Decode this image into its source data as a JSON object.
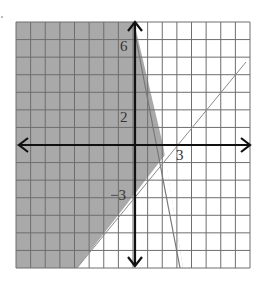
{
  "chart_data": {
    "type": "inequality-graph",
    "title": "",
    "xlabel": "",
    "ylabel": "",
    "xlim": [
      -8,
      8
    ],
    "ylim": [
      -7,
      7
    ],
    "grid": true,
    "tick_labels": {
      "x": [
        {
          "value": 3,
          "label": "3"
        }
      ],
      "y": [
        {
          "value": 6,
          "label": "6"
        },
        {
          "value": 2,
          "label": "2"
        },
        {
          "value": -3,
          "label": "-3"
        }
      ]
    },
    "lines": [
      {
        "name": "steep boundary",
        "equation": "y = -3.5x + 7",
        "style": "solid",
        "points": [
          [
            0,
            7
          ],
          [
            4,
            -7
          ]
        ]
      },
      {
        "name": "diagonal boundary",
        "equation": "y = x - 3",
        "style": "solid-thin",
        "points": [
          [
            -4,
            -7
          ],
          [
            8,
            5
          ]
        ]
      }
    ],
    "shaded_region": {
      "description": "y <= -3.5x + 7 and y >= x - 3 (left side)",
      "color": "#a8a8a8"
    }
  },
  "colors": {
    "shade": "#a9a9a9",
    "grid": "#6e6e6e",
    "axis": "#111111",
    "line": "#777777",
    "background": "#ffffff"
  },
  "labels": {
    "y6": "6",
    "y2": "2",
    "yneg3": "−3",
    "x3": "3"
  }
}
